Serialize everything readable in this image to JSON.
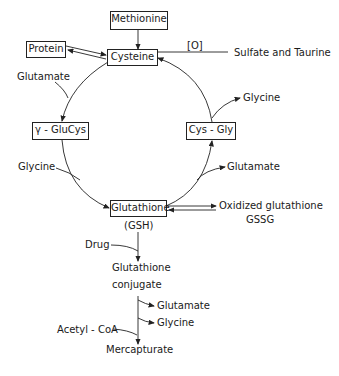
{
  "nodes": {
    "methionine": "Methionine",
    "cysteine": "Cysteine",
    "protein": "Protein",
    "gamma_glucys": "γ - GluCys",
    "cys_gly": "Cys - Gly",
    "glutathione": "Glutathione",
    "gsh": "(GSH)"
  },
  "labels": {
    "oxidation": "[O]",
    "sulfate_taurine": "Sulfate and Taurine",
    "glutamate_in": "Glutamate",
    "glycine_in": "Glycine",
    "glycine_out": "Glycine",
    "glutamate_out": "Glutamate",
    "oxidized_glutathione": "Oxidized glutathione",
    "gssg": "GSSG",
    "drug": "Drug",
    "conjugate_line1": "Glutathione",
    "conjugate_line2": "conjugate",
    "glutamate_conj": "Glutamate",
    "glycine_conj": "Glycine",
    "acetyl_coa": "Acetyl - CoA",
    "mercapturate": "Mercapturate"
  },
  "colors": {
    "line": "#222222",
    "background": "#ffffff"
  }
}
